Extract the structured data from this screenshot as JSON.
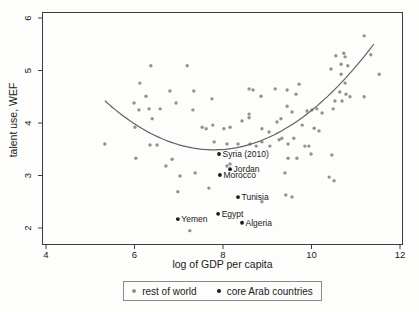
{
  "chart_data": {
    "type": "scatter",
    "title": "",
    "xlabel": "log of GDP per capita",
    "ylabel": "talent use, WEF",
    "xlim": [
      4,
      12
    ],
    "ylim": [
      2,
      6
    ],
    "xticks": [
      4,
      6,
      8,
      10,
      12
    ],
    "yticks": [
      2,
      3,
      4,
      5,
      6
    ],
    "grid": false,
    "legend_position": "bottom-center",
    "series": [
      {
        "name": "rest of world",
        "marker_color": "#8f948f",
        "points": [
          [
            6.37,
            5.09
          ],
          [
            6.12,
            4.76
          ],
          [
            6.26,
            4.51
          ],
          [
            5.99,
            4.38
          ],
          [
            6.1,
            4.25
          ],
          [
            6.33,
            4.27
          ],
          [
            6.58,
            4.27
          ],
          [
            6.4,
            4.08
          ],
          [
            6.01,
            3.92
          ],
          [
            6.35,
            3.58
          ],
          [
            6.51,
            3.58
          ],
          [
            5.33,
            3.6
          ],
          [
            6.03,
            3.33
          ],
          [
            7.19,
            5.09
          ],
          [
            6.8,
            4.61
          ],
          [
            7.34,
            4.61
          ],
          [
            6.94,
            4.38
          ],
          [
            7.32,
            4.25
          ],
          [
            7.75,
            4.46
          ],
          [
            8.59,
            4.65
          ],
          [
            8.68,
            4.63
          ],
          [
            8.86,
            4.51
          ],
          [
            9.18,
            4.65
          ],
          [
            8.02,
            3.89
          ],
          [
            7.77,
            3.96
          ],
          [
            7.53,
            3.92
          ],
          [
            7.62,
            3.89
          ],
          [
            8.16,
            3.92
          ],
          [
            8.43,
            4.04
          ],
          [
            8.59,
            4.17
          ],
          [
            8.59,
            4.1
          ],
          [
            8.88,
            3.89
          ],
          [
            9.04,
            3.83
          ],
          [
            9.22,
            4.02
          ],
          [
            9.31,
            4.08
          ],
          [
            7.8,
            3.64
          ],
          [
            8.09,
            3.6
          ],
          [
            8.34,
            3.6
          ],
          [
            8.61,
            3.6
          ],
          [
            8.75,
            3.56
          ],
          [
            8.88,
            3.64
          ],
          [
            9.06,
            3.56
          ],
          [
            9.27,
            3.68
          ],
          [
            6.85,
            3.31
          ],
          [
            6.71,
            3.18
          ],
          [
            7.37,
            3.05
          ],
          [
            7.03,
            2.99
          ],
          [
            7.68,
            2.76
          ],
          [
            6.98,
            2.69
          ],
          [
            8.88,
            2.5
          ],
          [
            7.25,
            1.95
          ],
          [
            8.09,
            3.18
          ],
          [
            8.16,
            3.22
          ],
          [
            11.19,
            5.66
          ],
          [
            10.55,
            5.28
          ],
          [
            10.73,
            5.33
          ],
          [
            10.76,
            5.26
          ],
          [
            11.34,
            5.3
          ],
          [
            10.44,
            5.03
          ],
          [
            10.67,
            5.12
          ],
          [
            10.82,
            5.09
          ],
          [
            10.67,
            4.93
          ],
          [
            11.53,
            4.93
          ],
          [
            10.76,
            4.76
          ],
          [
            9.72,
            4.74
          ],
          [
            9.45,
            4.63
          ],
          [
            9.65,
            4.55
          ],
          [
            10.64,
            4.59
          ],
          [
            10.78,
            4.55
          ],
          [
            10.87,
            4.5
          ],
          [
            10.53,
            4.42
          ],
          [
            10.69,
            4.42
          ],
          [
            11.19,
            4.5
          ],
          [
            9.45,
            4.32
          ],
          [
            9.56,
            4.21
          ],
          [
            9.9,
            4.23
          ],
          [
            10.01,
            4.25
          ],
          [
            10.12,
            4.27
          ],
          [
            10.49,
            4.27
          ],
          [
            10.24,
            4.19
          ],
          [
            9.79,
            3.96
          ],
          [
            10.06,
            3.9
          ],
          [
            10.17,
            3.85
          ],
          [
            9.6,
            3.71
          ],
          [
            9.33,
            3.71
          ],
          [
            9.47,
            3.6
          ],
          [
            9.85,
            3.56
          ],
          [
            9.94,
            3.56
          ],
          [
            9.99,
            3.41
          ],
          [
            9.67,
            3.33
          ],
          [
            9.47,
            3.33
          ],
          [
            10.46,
            3.39
          ],
          [
            9.4,
            3.05
          ],
          [
            10.4,
            2.97
          ],
          [
            10.51,
            2.9
          ],
          [
            9.42,
            2.63
          ],
          [
            9.56,
            2.59
          ]
        ]
      },
      {
        "name": "core Arab countries",
        "marker_color": "#1a1a1a",
        "points": [
          {
            "x": 7.91,
            "y": 3.41,
            "label": "Syria (2010)"
          },
          {
            "x": 8.16,
            "y": 3.12,
            "label": "Jordan"
          },
          {
            "x": 7.93,
            "y": 3.01,
            "label": "Morocco"
          },
          {
            "x": 8.34,
            "y": 2.59,
            "label": "Tunisia"
          },
          {
            "x": 7.89,
            "y": 2.27,
            "label": "Egypt"
          },
          {
            "x": 6.98,
            "y": 2.17,
            "label": "Yemen"
          },
          {
            "x": 8.43,
            "y": 2.1,
            "label": "Algeria"
          }
        ]
      }
    ],
    "fit_curve": {
      "shape": "quadratic",
      "description": "U-shaped fitted curve, minimum near x=7.8, y=3.5",
      "a": 0.154,
      "b": -2.4,
      "c": 12.84,
      "x_start": 5.33,
      "x_end": 11.48,
      "color": "#616161"
    },
    "colors": {
      "axis": "#3c3c3c",
      "text": "#1a1a1a",
      "plot_background": "#fdfdfc"
    }
  }
}
